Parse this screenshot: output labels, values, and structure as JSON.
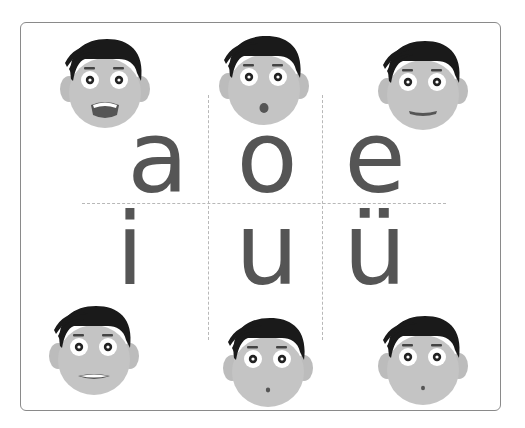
{
  "card": {
    "title": "Pinyin single vowels",
    "border_color": "#8a8a8a",
    "grid_color": "#b8b8b8",
    "letter_color": "#555555"
  },
  "vowels": [
    {
      "letter": "a",
      "mouth": "wide-open"
    },
    {
      "letter": "o",
      "mouth": "round-small"
    },
    {
      "letter": "e",
      "mouth": "flat-smile"
    },
    {
      "letter": "i",
      "mouth": "teeth-flat"
    },
    {
      "letter": "u",
      "mouth": "tiny-round"
    },
    {
      "letter": "ü",
      "mouth": "tiny-round"
    }
  ],
  "colors": {
    "hair": "#1a1a1a",
    "skin": "#c4c4c4",
    "ear": "#bcbcbc",
    "eye_white": "#ffffff",
    "pupil": "#222222",
    "mouth": "#555555"
  }
}
